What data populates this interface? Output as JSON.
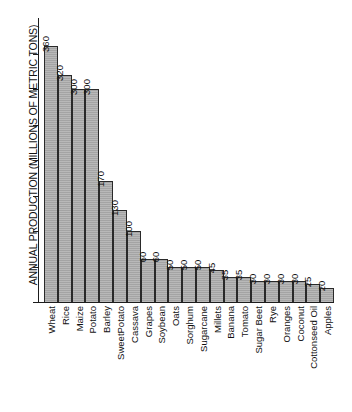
{
  "chart_data": {
    "type": "bar",
    "title": "",
    "xlabel": "",
    "ylabel": "ANNUAL PRODUCTION (MILLIONS OF METRIC TONS)",
    "ylim": [
      0,
      400
    ],
    "grid": false,
    "legend": "none",
    "y_ticks": [
      0,
      50,
      100,
      150,
      200,
      250,
      300,
      350
    ],
    "y_tick_labels": [
      "",
      "",
      "",
      "",
      "",
      "",
      "",
      ""
    ],
    "value_labels_shown": true,
    "orientation": "vertical",
    "bar_color": "#ababab",
    "bar_edge_color": "#2a2a2a",
    "categories": [
      "Wheat",
      "Rice",
      "Maize",
      "Potato",
      "Barley",
      "SweetPotato",
      "Cassava",
      "Grapes",
      "Soybean",
      "Oats",
      "Sorghum",
      "Sugarcane",
      "Millets",
      "Banana",
      "Tomato",
      "Sugar Beet",
      "Rye",
      "Oranges",
      "Coconut",
      "Cottonseed Oil",
      "Apples"
    ],
    "values": [
      360,
      320,
      300,
      300,
      170,
      130,
      100,
      60,
      60,
      50,
      50,
      50,
      45,
      35,
      35,
      30,
      30,
      30,
      30,
      25,
      20
    ],
    "value_label_strings": [
      "360",
      "320",
      "300",
      "300",
      "170",
      "130",
      "100",
      "60",
      "60",
      "50",
      "50",
      "50",
      "45",
      "35",
      "35",
      "30",
      "30",
      "30",
      "30",
      "25",
      "20"
    ]
  }
}
